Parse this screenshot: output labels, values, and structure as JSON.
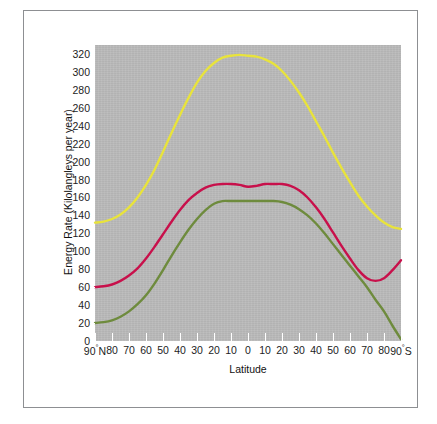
{
  "figure": {
    "background_color": "#ffffff",
    "frame_color": "#8d8f92",
    "panel_color": "#b9b9b9"
  },
  "chart_data": {
    "type": "line",
    "title": "",
    "xlabel": "Latitude",
    "ylabel": "Energy Rate (Kilolangleys per year)",
    "xlim": [
      -90,
      90
    ],
    "ylim": [
      0,
      330
    ],
    "ytick_labels": [
      "320",
      "300",
      "280",
      "260",
      "240",
      "220",
      "200",
      "180",
      "160",
      "140",
      "120",
      "100",
      "80",
      "60",
      "40",
      "20",
      "0"
    ],
    "ytick_values": [
      320,
      300,
      280,
      260,
      240,
      220,
      200,
      180,
      160,
      140,
      120,
      100,
      80,
      60,
      40,
      20,
      0
    ],
    "xtick_labels": [
      "90°N",
      "80",
      "70",
      "60",
      "50",
      "40",
      "30",
      "20",
      "10",
      "0",
      "10",
      "20",
      "30",
      "40",
      "50",
      "60",
      "70",
      "80",
      "90°S"
    ],
    "xtick_values": [
      -90,
      -80,
      -70,
      -60,
      -50,
      -40,
      -30,
      -20,
      -10,
      0,
      10,
      20,
      30,
      40,
      50,
      60,
      70,
      80,
      90
    ],
    "grid": false,
    "legend": "none",
    "x": [
      -90,
      -85,
      -80,
      -75,
      -70,
      -65,
      -60,
      -55,
      -50,
      -45,
      -40,
      -35,
      -30,
      -25,
      -20,
      -15,
      -10,
      -5,
      0,
      5,
      10,
      15,
      20,
      25,
      30,
      35,
      40,
      45,
      50,
      55,
      60,
      65,
      70,
      75,
      80,
      85,
      90
    ],
    "series": [
      {
        "name": "top-of-atmosphere-solar-radiation",
        "color": "#e8e33c",
        "values": [
          132,
          133,
          136,
          141,
          149,
          160,
          174,
          191,
          211,
          232,
          252,
          271,
          288,
          301,
          310,
          316,
          318,
          319,
          318,
          317,
          314,
          309,
          301,
          290,
          277,
          262,
          245,
          228,
          210,
          193,
          177,
          162,
          150,
          140,
          132,
          127,
          125
        ]
      },
      {
        "name": "absorbed-solar-radiation",
        "color": "#c8104b",
        "values": [
          60,
          61,
          63,
          67,
          73,
          81,
          92,
          105,
          119,
          133,
          146,
          157,
          165,
          171,
          174,
          175,
          175,
          174,
          172,
          173,
          175,
          175,
          175,
          173,
          168,
          160,
          149,
          136,
          121,
          106,
          92,
          79,
          70,
          67,
          70,
          79,
          90
        ]
      },
      {
        "name": "outgoing-longwave-radiation",
        "color": "#6e8b3d",
        "values": [
          20,
          21,
          23,
          27,
          33,
          41,
          51,
          64,
          79,
          95,
          110,
          124,
          136,
          146,
          153,
          156,
          156,
          156,
          156,
          156,
          156,
          156,
          155,
          152,
          147,
          140,
          131,
          120,
          108,
          96,
          84,
          72,
          60,
          46,
          33,
          17,
          2
        ]
      }
    ]
  }
}
